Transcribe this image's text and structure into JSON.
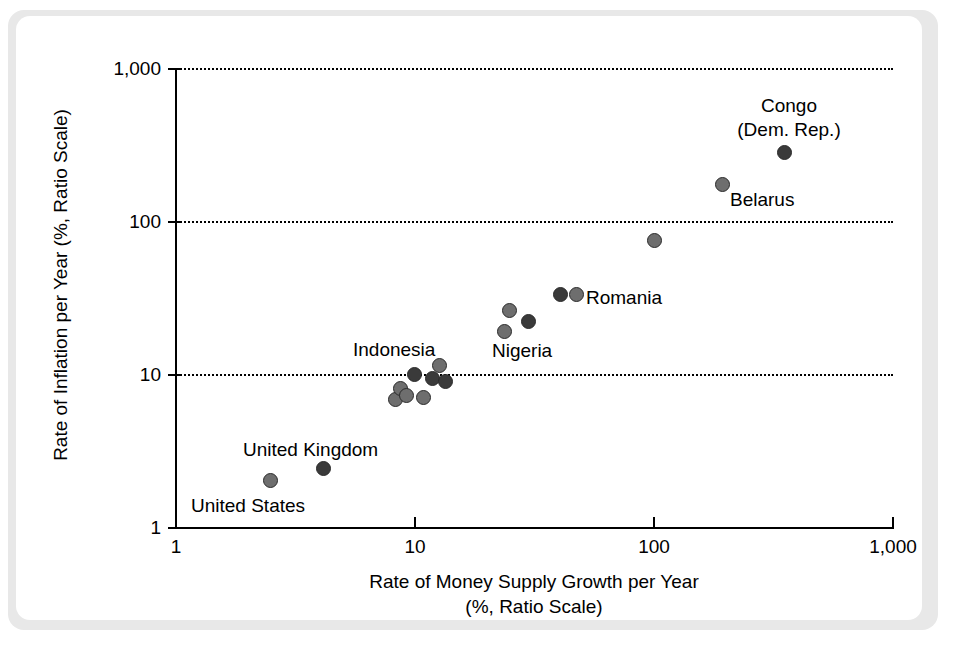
{
  "figure": {
    "background_color": "#e8e8e8",
    "card_color": "#ffffff"
  },
  "axes": {
    "x_title_line1": "Rate of Money Supply Growth per Year",
    "x_title_line2": "(%, Ratio Scale)",
    "y_title": "Rate of Inflation per Year (%, Ratio Scale)",
    "x_ticks": [
      "1",
      "10",
      "100",
      "1,000"
    ],
    "y_ticks": [
      "1,000",
      "100",
      "10",
      "1"
    ]
  },
  "annotations": [
    {
      "name": "congo",
      "text": "Congo\n(Dem. Rep.)",
      "align": "center"
    },
    {
      "name": "belarus",
      "text": "Belarus",
      "align": "left"
    },
    {
      "name": "romania",
      "text": "Romania",
      "align": "left"
    },
    {
      "name": "nigeria",
      "text": "Nigeria",
      "align": "left"
    },
    {
      "name": "indonesia",
      "text": "Indonesia",
      "align": "left"
    },
    {
      "name": "united-kingdom",
      "text": "United Kingdom",
      "align": "left"
    },
    {
      "name": "united-states",
      "text": "United States",
      "align": "left"
    }
  ],
  "chart_data": {
    "type": "scatter",
    "title": "",
    "xlabel": "Rate of Money Supply Growth per Year (%, Ratio Scale)",
    "ylabel": "Rate of Inflation per Year (%, Ratio Scale)",
    "xscale": "log",
    "yscale": "log",
    "xlim": [
      1,
      1000
    ],
    "ylim": [
      1,
      1000
    ],
    "xticks": [
      1,
      10,
      100,
      1000
    ],
    "yticks": [
      1,
      10,
      100,
      1000
    ],
    "grid": "horizontal dotted gridlines at y = 10, 100, 1000",
    "legend": "none",
    "marker_colors": [
      "#6e6e6e",
      "#3a3a3a"
    ],
    "points": [
      {
        "label": "United States",
        "x": 2.5,
        "y": 2.0,
        "shade": "mid"
      },
      {
        "label": "United Kingdom",
        "x": 4.2,
        "y": 2.4,
        "shade": "dark"
      },
      {
        "label": "",
        "x": 8.4,
        "y": 6.8,
        "shade": "mid"
      },
      {
        "label": "",
        "x": 8.8,
        "y": 8.0,
        "shade": "mid"
      },
      {
        "label": "",
        "x": 9.3,
        "y": 7.2,
        "shade": "mid"
      },
      {
        "label": "Indonesia",
        "x": 10.0,
        "y": 10.0,
        "shade": "dark"
      },
      {
        "label": "",
        "x": 11.0,
        "y": 7.0,
        "shade": "mid"
      },
      {
        "label": "",
        "x": 12.0,
        "y": 9.3,
        "shade": "dark"
      },
      {
        "label": "",
        "x": 12.8,
        "y": 11.3,
        "shade": "mid"
      },
      {
        "label": "",
        "x": 13.6,
        "y": 8.9,
        "shade": "dark"
      },
      {
        "label": "",
        "x": 24.0,
        "y": 19.0,
        "shade": "mid"
      },
      {
        "label": "",
        "x": 25.0,
        "y": 26.0,
        "shade": "mid"
      },
      {
        "label": "Nigeria",
        "x": 30.0,
        "y": 22.0,
        "shade": "dark"
      },
      {
        "label": "",
        "x": 41.0,
        "y": 33.0,
        "shade": "dark"
      },
      {
        "label": "Romania",
        "x": 48.0,
        "y": 33.0,
        "shade": "mid"
      },
      {
        "label": "",
        "x": 101.0,
        "y": 75.0,
        "shade": "mid"
      },
      {
        "label": "Belarus",
        "x": 195.0,
        "y": 172.0,
        "shade": "mid"
      },
      {
        "label": "Congo (Dem. Rep.)",
        "x": 355.0,
        "y": 282.0,
        "shade": "dark"
      }
    ]
  }
}
